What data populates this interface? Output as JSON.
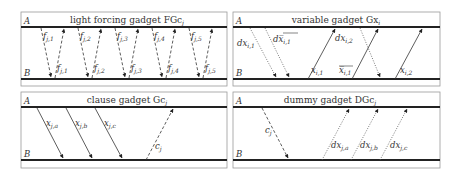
{
  "panels": [
    {
      "id": "light-forcing",
      "title": "light forcing gadget FGc",
      "title_sub": "j",
      "rail_top_label": "A",
      "rail_bottom_label": "B",
      "arrows": [
        {
          "label": "f",
          "sub": "j,1",
          "direction": "down",
          "style": "dashed"
        },
        {
          "label": "f",
          "sub": "j,1",
          "direction": "up",
          "style": "dashed"
        },
        {
          "label": "f",
          "sub": "j,2",
          "direction": "down",
          "style": "dashed"
        },
        {
          "label": "f",
          "sub": "j,2",
          "direction": "up",
          "style": "dashed"
        },
        {
          "label": "f",
          "sub": "j,3",
          "direction": "down",
          "style": "dashed"
        },
        {
          "label": "f",
          "sub": "j,3",
          "direction": "up",
          "style": "dashed"
        },
        {
          "label": "f",
          "sub": "j,4",
          "direction": "down",
          "style": "dashed"
        },
        {
          "label": "f",
          "sub": "j,4",
          "direction": "up",
          "style": "dashed"
        },
        {
          "label": "f",
          "sub": "j,5",
          "direction": "down",
          "style": "dashed"
        },
        {
          "label": "f",
          "sub": "j,5",
          "direction": "up",
          "style": "dashed"
        }
      ]
    },
    {
      "id": "variable",
      "title": "variable gadget Gx",
      "title_sub": "i",
      "rail_top_label": "A",
      "rail_bottom_label": "B",
      "arrows": [
        {
          "label": "dx",
          "sub": "i,1",
          "direction": "down",
          "style": "dotted"
        },
        {
          "label": "dx̅",
          "sub": "i,1",
          "direction": "down",
          "style": "dotted",
          "overline": true
        },
        {
          "label": "x",
          "sub": "i,1",
          "direction": "up",
          "style": "solid"
        },
        {
          "label": "dx",
          "sub": "i,2",
          "direction": "down",
          "style": "dotted"
        },
        {
          "label": "x̅",
          "sub": "i,1",
          "direction": "up",
          "style": "solid",
          "overline": true
        },
        {
          "label": "x",
          "sub": "i,2",
          "direction": "up",
          "style": "solid"
        }
      ]
    },
    {
      "id": "clause",
      "title": "clause gadget Gc",
      "title_sub": "j",
      "rail_top_label": "A",
      "rail_bottom_label": "B",
      "arrows": [
        {
          "label": "x",
          "sub": "j,a",
          "direction": "down",
          "style": "solid"
        },
        {
          "label": "x",
          "sub": "j,b",
          "direction": "down",
          "style": "solid"
        },
        {
          "label": "x",
          "sub": "j,c",
          "direction": "down",
          "style": "solid"
        },
        {
          "label": "c",
          "sub": "j",
          "direction": "up",
          "style": "dashed"
        }
      ]
    },
    {
      "id": "dummy",
      "title": "dummy gadget DGc",
      "title_sub": "j",
      "rail_top_label": "A",
      "rail_bottom_label": "B",
      "arrows": [
        {
          "label": "c",
          "sub": "j",
          "direction": "down",
          "style": "dashed"
        },
        {
          "label": "dx",
          "sub": "j,a",
          "direction": "up",
          "style": "dotted"
        },
        {
          "label": "dx",
          "sub": "j,b",
          "direction": "up",
          "style": "dotted"
        },
        {
          "label": "dx",
          "sub": "j,c",
          "direction": "up",
          "style": "dotted"
        }
      ]
    }
  ]
}
